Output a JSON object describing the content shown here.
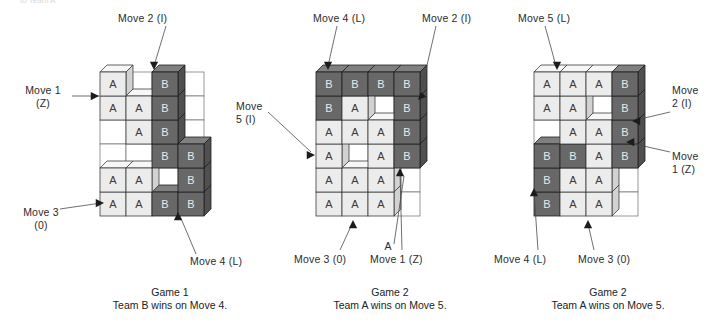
{
  "figure": {
    "cutoff_text": "to Team A",
    "board_cols": 4,
    "board_rows": 6,
    "cell_codes": {
      "empty": ".",
      "team_a": "A",
      "team_b": "B"
    }
  },
  "games": [
    {
      "id": "game-1",
      "caption_title": "Game 1",
      "caption_result": "Team B wins on Move 4.",
      "origin": {
        "x": 100,
        "y": 72
      },
      "grid": [
        [
          "A",
          ".",
          "B",
          "."
        ],
        [
          "A",
          "A",
          "B",
          "."
        ],
        [
          ".",
          "A",
          "B",
          "."
        ],
        [
          ".",
          ".",
          "B",
          "B"
        ],
        [
          "A",
          "A",
          ".",
          "B"
        ],
        [
          "A",
          "A",
          "B",
          "B"
        ]
      ],
      "labels": [
        {
          "name": "move-1-z",
          "text": "Move 1\n(Z)",
          "x": 14,
          "y": 84,
          "w": 58,
          "align": "center",
          "line": {
            "x1": 72,
            "y1": 96,
            "x2": 99,
            "y2": 96
          },
          "arrow": {
            "x": 99,
            "y": 96,
            "dir": "right"
          }
        },
        {
          "name": "move-2-i",
          "text": "Move 2 (I)",
          "x": 118,
          "y": 12,
          "w": 62,
          "align": "left",
          "line": {
            "x1": 166,
            "y1": 26,
            "x2": 154,
            "y2": 66
          },
          "arrow": {
            "x": 154,
            "y": 70,
            "dir": "down"
          }
        },
        {
          "name": "move-3-o",
          "text": "Move 3\n(0)",
          "x": 12,
          "y": 206,
          "w": 58,
          "align": "center",
          "line": {
            "x1": 60,
            "y1": 209,
            "x2": 101,
            "y2": 203
          },
          "arrow": {
            "x": 104,
            "y": 203,
            "dir": "right"
          }
        },
        {
          "name": "move-4-l",
          "text": "Move 4 (L)",
          "x": 190,
          "y": 255,
          "w": 64,
          "align": "left",
          "line": {
            "x1": 196,
            "y1": 254,
            "x2": 180,
            "y2": 216
          },
          "arrow": {
            "x": 178,
            "y": 212,
            "dir": "up"
          }
        }
      ]
    },
    {
      "id": "game-2",
      "caption_title": "Game 2",
      "caption_result": "Team A wins on Move 5.",
      "origin": {
        "x": 316,
        "y": 72
      },
      "grid": [
        [
          "B",
          "B",
          "B",
          "B"
        ],
        [
          "B",
          "A",
          ".",
          "B"
        ],
        [
          "A",
          "A",
          "A",
          "B"
        ],
        [
          "A",
          ".",
          "A",
          "B"
        ],
        [
          "A",
          "A",
          "A",
          "."
        ],
        [
          "A",
          "A",
          "A",
          "."
        ]
      ],
      "labels": [
        {
          "name": "move-4-l",
          "text": "Move 4 (L)",
          "x": 313,
          "y": 12,
          "w": 64,
          "align": "left",
          "line": {
            "x1": 337,
            "y1": 26,
            "x2": 328,
            "y2": 66
          },
          "arrow": {
            "x": 328,
            "y": 70,
            "dir": "down"
          }
        },
        {
          "name": "move-2-i",
          "text": "Move 2 (I)",
          "x": 422,
          "y": 12,
          "w": 62,
          "align": "left",
          "line": {
            "x1": 436,
            "y1": 26,
            "x2": 420,
            "y2": 96
          },
          "arrow": {
            "x": 418,
            "y": 100,
            "dir": "downleft"
          }
        },
        {
          "name": "move-5-i",
          "text": "Move\n5 (I)",
          "x": 236,
          "y": 100,
          "w": 48,
          "align": "left",
          "line": {
            "x1": 268,
            "y1": 112,
            "x2": 311,
            "y2": 152
          },
          "arrow": {
            "x": 315,
            "y": 155,
            "dir": "right"
          }
        },
        {
          "name": "move-3-o",
          "text": "Move 3 (0)",
          "x": 294,
          "y": 253,
          "w": 64,
          "align": "left",
          "line": {
            "x1": 340,
            "y1": 250,
            "x2": 352,
            "y2": 224
          },
          "arrow": {
            "x": 353,
            "y": 220,
            "dir": "up"
          }
        },
        {
          "name": "cell-marker-a",
          "text": "A",
          "x": 382,
          "y": 240,
          "w": 12,
          "align": "center",
          "line": {
            "x1": 394,
            "y1": 244,
            "x2": 404,
            "y2": 176
          },
          "arrow": null
        },
        {
          "name": "move-1-z",
          "text": "Move 1 (Z)",
          "x": 370,
          "y": 253,
          "w": 64,
          "align": "left",
          "line": {
            "x1": 402,
            "y1": 250,
            "x2": 400,
            "y2": 172
          },
          "arrow": {
            "x": 400,
            "y": 168,
            "dir": "up"
          }
        }
      ]
    },
    {
      "id": "game-3",
      "caption_title": "Game 2",
      "caption_result": "Team A wins on Move 5.",
      "origin": {
        "x": 534,
        "y": 72
      },
      "grid": [
        [
          "A",
          "A",
          "A",
          "B"
        ],
        [
          "A",
          "A",
          ".",
          "B"
        ],
        [
          ".",
          "A",
          "A",
          "B"
        ],
        [
          "B",
          "B",
          "A",
          "B"
        ],
        [
          "B",
          "A",
          "A",
          "."
        ],
        [
          "B",
          "A",
          "A",
          "."
        ]
      ],
      "labels": [
        {
          "name": "move-5-l",
          "text": "Move 5 (L)",
          "x": 518,
          "y": 12,
          "w": 64,
          "align": "left",
          "line": {
            "x1": 545,
            "y1": 26,
            "x2": 556,
            "y2": 66
          },
          "arrow": {
            "x": 557,
            "y": 70,
            "dir": "down"
          }
        },
        {
          "name": "move-2-i",
          "text": "Move\n2 (I)",
          "x": 672,
          "y": 84,
          "w": 44,
          "align": "left",
          "line": {
            "x1": 670,
            "y1": 112,
            "x2": 636,
            "y2": 120
          },
          "arrow": {
            "x": 632,
            "y": 121,
            "dir": "left"
          }
        },
        {
          "name": "move-1-z",
          "text": "Move\n1 (Z)",
          "x": 672,
          "y": 150,
          "w": 44,
          "align": "left",
          "line": {
            "x1": 670,
            "y1": 152,
            "x2": 630,
            "y2": 143
          },
          "arrow": {
            "x": 626,
            "y": 142,
            "dir": "left"
          }
        },
        {
          "name": "move-4-l",
          "text": "Move 4 (L)",
          "x": 494,
          "y": 253,
          "w": 64,
          "align": "left",
          "line": {
            "x1": 538,
            "y1": 250,
            "x2": 534,
            "y2": 192
          },
          "arrow": {
            "x": 534,
            "y": 188,
            "dir": "up"
          }
        },
        {
          "name": "move-3-o",
          "text": "Move 3 (0)",
          "x": 578,
          "y": 253,
          "w": 64,
          "align": "left",
          "line": {
            "x1": 594,
            "y1": 250,
            "x2": 588,
            "y2": 224
          },
          "arrow": {
            "x": 588,
            "y": 220,
            "dir": "up"
          }
        }
      ]
    }
  ],
  "captions": [
    {
      "name": "caption-game-1",
      "x": 60,
      "y": 286,
      "w": 220
    },
    {
      "name": "caption-game-2",
      "x": 280,
      "y": 286,
      "w": 220
    },
    {
      "name": "caption-game-3",
      "x": 498,
      "y": 286,
      "w": 220
    }
  ],
  "colors": {
    "team_a_face": "#ececec",
    "team_b_face": "#686868",
    "empty_face": "#ffffff",
    "outline": "#3c3c3c",
    "arrow": "#1c1c1c"
  },
  "geometry": {
    "cell_w": 26,
    "cell_h": 24,
    "depth_x": 7,
    "depth_y": -7
  }
}
